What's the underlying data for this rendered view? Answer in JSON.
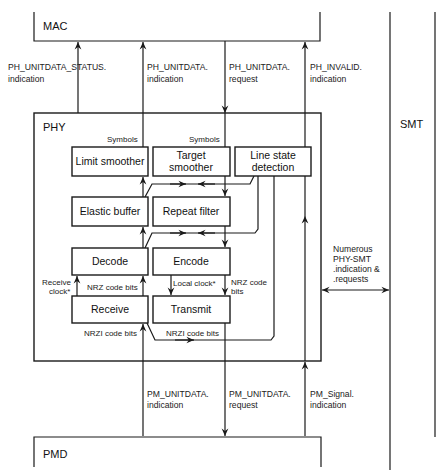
{
  "layers": {
    "mac": "MAC",
    "phy": "PHY",
    "pmd": "PMD",
    "smt": "SMT"
  },
  "mac_phy_primitives": [
    {
      "line1": "PH_UNITDATA_STATUS.",
      "line2": "indication",
      "direction": "up"
    },
    {
      "line1": "PH_UNITDATA.",
      "line2": "indication",
      "direction": "up"
    },
    {
      "line1": "PH_UNITDATA.",
      "line2": "request",
      "direction": "down"
    },
    {
      "line1": "PH_INVALID.",
      "line2": "indication",
      "direction": "up"
    }
  ],
  "phy_pmd_primitives": [
    {
      "line1": "PM_UNITDATA.",
      "line2": "indication",
      "direction": "up"
    },
    {
      "line1": "PM_UNITDATA.",
      "line2": "request",
      "direction": "down"
    },
    {
      "line1": "PM_Signal.",
      "line2": "indication",
      "direction": "up"
    }
  ],
  "phy_blocks": {
    "limit_smoother": "Limit smoother",
    "target_smoother_1": "Target",
    "target_smoother_2": "smoother",
    "line_state_1": "Line state",
    "line_state_2": "detection",
    "elastic_buffer": "Elastic buffer",
    "repeat_filter": "Repeat filter",
    "decode": "Decode",
    "encode": "Encode",
    "receive": "Receive",
    "transmit": "Transmit"
  },
  "phy_labels": {
    "symbols_left": "Symbols",
    "symbols_right": "Symbols",
    "receive_clock_1": "Receive",
    "receive_clock_2": "clock*",
    "nrz_code_bits_rx": "NRZ code bits",
    "local_clock": "Local clock*",
    "nrz_code_tx_1": "NRZ code",
    "nrz_code_tx_2": "bits",
    "nrzi_code_bits_rx": "NRZI code bits",
    "nrzi_code_bits_tx": "NRZI code bits"
  },
  "smt_interface": {
    "line1": "Numerous",
    "line2": "PHY-SMT",
    "line3": ".indication &",
    "line4": ".requests"
  }
}
